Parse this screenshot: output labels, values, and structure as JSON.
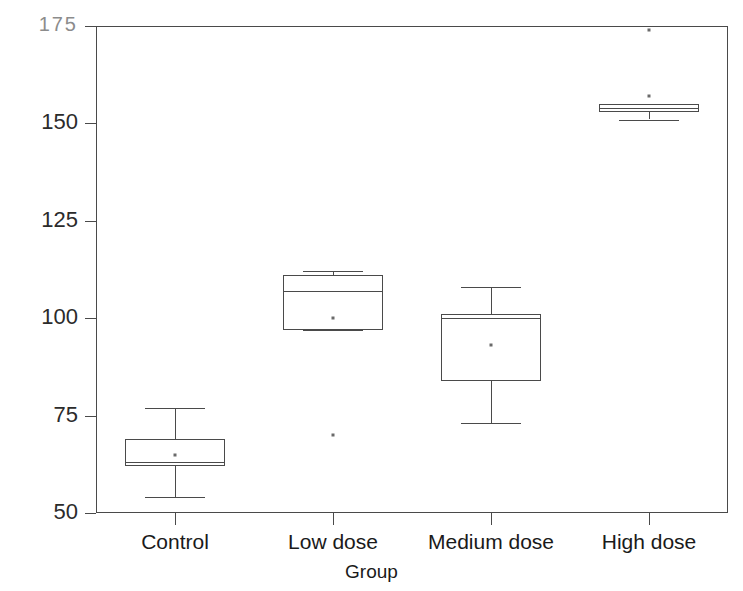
{
  "chart_data": {
    "type": "boxplot",
    "title": "",
    "xlabel": "Group",
    "ylabel": "Activated clotting times",
    "categories": [
      "Control",
      "Low dose",
      "Medium dose",
      "High dose"
    ],
    "ylim": [
      50,
      175
    ],
    "yticks": [
      175,
      150,
      125,
      100,
      75,
      50
    ],
    "ytick_labels": [
      "175",
      "150",
      "125",
      "100",
      "75",
      "50"
    ],
    "grid": false,
    "legend": "none",
    "boxes": [
      {
        "category": "Control",
        "whisker_low": 54,
        "q1": 62,
        "median": 63,
        "q3": 69,
        "whisker_high": 77,
        "mean": 65,
        "outliers": []
      },
      {
        "category": "Low dose",
        "whisker_low": 97,
        "q1": 97,
        "median": 107,
        "q3": 111,
        "whisker_high": 112,
        "mean": 100,
        "outliers": [
          70
        ]
      },
      {
        "category": "Medium dose",
        "whisker_low": 73,
        "q1": 84,
        "median": 100,
        "q3": 101,
        "whisker_high": 108,
        "mean": 93,
        "outliers": []
      },
      {
        "category": "High dose",
        "whisker_low": 151,
        "q1": 153,
        "median": 154,
        "q3": 155,
        "whisker_high": 155,
        "mean": 157,
        "outliers": [
          174
        ]
      }
    ]
  },
  "axes": {
    "y_title": "Activated clotting times",
    "x_title": "Group",
    "y_labels": [
      "175",
      "150",
      "125",
      "100",
      "75",
      "50"
    ],
    "x_labels": [
      "Control",
      "Low dose",
      "Medium dose",
      "High dose"
    ]
  },
  "style": {
    "line_color": "#4a4a4a",
    "text_color": "#1a1a1a",
    "faint_label_color": "#8c8c8c",
    "background": "#ffffff",
    "marker_color": "#6a6a6a"
  },
  "top_sliver_text": ""
}
